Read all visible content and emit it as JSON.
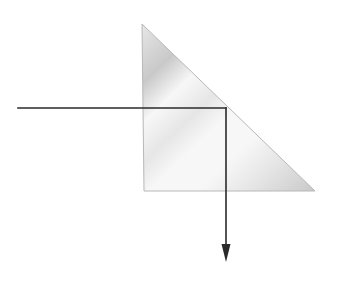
{
  "diagram": {
    "canvas": {
      "width": 345,
      "height": 285,
      "background": "#ffffff"
    },
    "prism": {
      "shape": "right-angle-triangle",
      "vertices": {
        "top": [
          142,
          24
        ],
        "bottom_left": [
          144,
          191
        ],
        "bottom_right": [
          315,
          191
        ]
      },
      "edge_color": "#b8b8b8",
      "fill_colors": {
        "light": "#f7f7f7",
        "mid": "#e6e6e6",
        "dark": "#c9c9c9"
      }
    },
    "ray": {
      "color": "#2a2a2a",
      "width": 1.6,
      "incident": {
        "from": [
          18,
          108
        ],
        "to": [
          226,
          108
        ]
      },
      "reflected": {
        "from": [
          226,
          108
        ],
        "to": [
          226,
          262
        ]
      },
      "arrowhead": {
        "tip": [
          226,
          262
        ],
        "base_y": 244,
        "half_width": 4.5
      }
    }
  }
}
